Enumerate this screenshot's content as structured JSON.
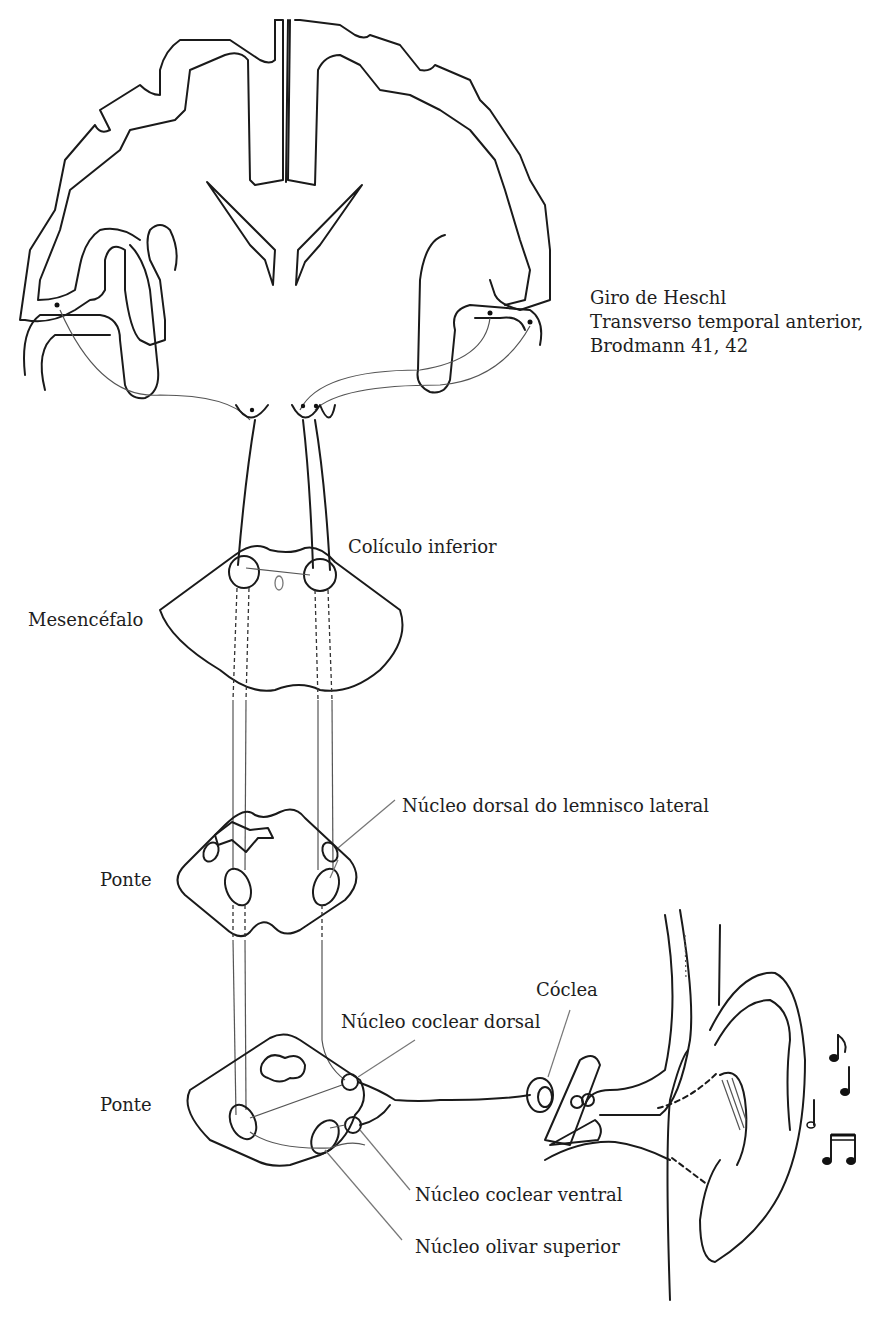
{
  "diagram": {
    "labels": {
      "heschl_line1": "Giro de Heschl",
      "heschl_line2": "Transverso temporal anterior,",
      "heschl_line3": "Brodmann 41, 42",
      "coliculo": "Colículo inferior",
      "mesencefalo": "Mesencéfalo",
      "lemnisco": "Núcleo dorsal do lemnisco lateral",
      "ponte_upper": "Ponte",
      "coclea": "Cóclea",
      "coclear_dorsal": "Núcleo coclear dorsal",
      "ponte_lower": "Ponte",
      "coclear_ventral": "Núcleo coclear ventral",
      "olivar": "Núcleo olivar superior"
    },
    "structures": [
      "brain-coronal-section",
      "midbrain-section",
      "upper-pons-section",
      "lower-pons-section",
      "ear-and-cochlea",
      "music-notes"
    ],
    "colors": {
      "line": "#1a1a1a",
      "leader": "#777777",
      "background": "#ffffff"
    }
  }
}
